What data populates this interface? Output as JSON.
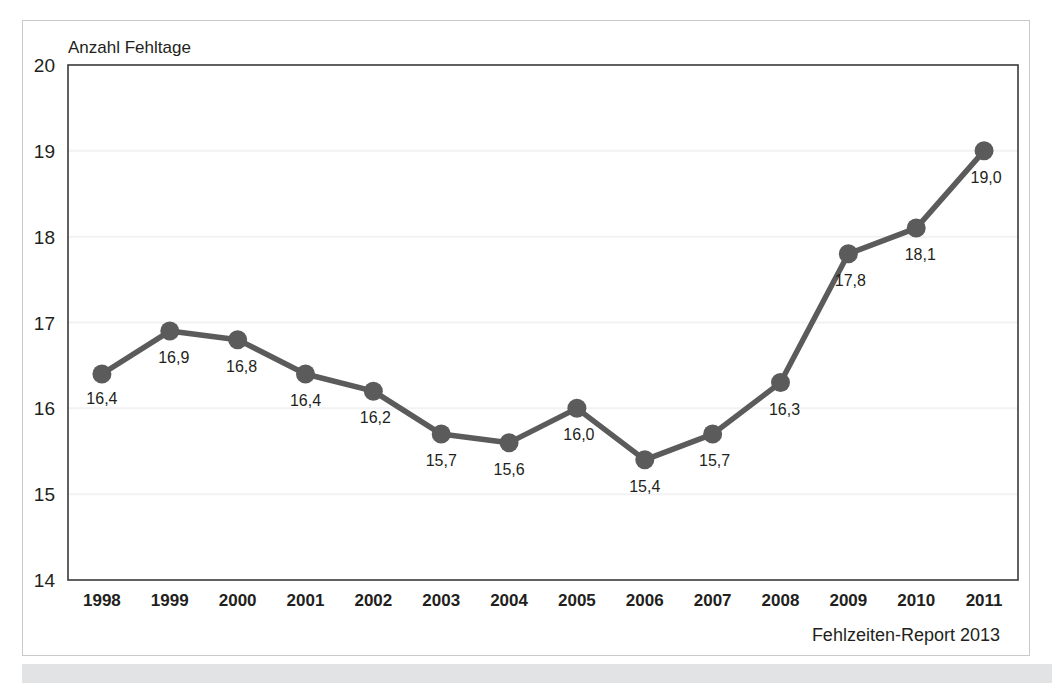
{
  "figure": {
    "footer_note": "Fehlzeiten-Report 2013"
  },
  "chart_data": {
    "type": "line",
    "title": "",
    "ylabel": "Anzahl Fehltage",
    "xlabel": "",
    "categories": [
      "1998",
      "1999",
      "2000",
      "2001",
      "2002",
      "2003",
      "2004",
      "2005",
      "2006",
      "2007",
      "2008",
      "2009",
      "2010",
      "2011"
    ],
    "values": [
      16.4,
      16.9,
      16.8,
      16.4,
      16.2,
      15.7,
      15.6,
      16.0,
      15.4,
      15.7,
      16.3,
      17.8,
      18.1,
      19.0
    ],
    "point_labels": [
      "16,4",
      "16,9",
      "16,8",
      "16,4",
      "16,2",
      "15,7",
      "15,6",
      "16,0",
      "15,4",
      "15,7",
      "16,3",
      "17,8",
      "18,1",
      "19,0"
    ],
    "label_offsets": [
      {
        "dx": 0,
        "dy": 30
      },
      {
        "dx": 4,
        "dy": 32
      },
      {
        "dx": 4,
        "dy": 32
      },
      {
        "dx": 0,
        "dy": 32
      },
      {
        "dx": 2,
        "dy": 32
      },
      {
        "dx": 0,
        "dy": 32
      },
      {
        "dx": 0,
        "dy": 32
      },
      {
        "dx": 2,
        "dy": 32
      },
      {
        "dx": 0,
        "dy": 32
      },
      {
        "dx": 2,
        "dy": 32
      },
      {
        "dx": 4,
        "dy": 32
      },
      {
        "dx": 2,
        "dy": 32
      },
      {
        "dx": 4,
        "dy": 32
      },
      {
        "dx": 2,
        "dy": 32
      }
    ],
    "yticks": [
      14,
      15,
      16,
      17,
      18,
      19,
      20
    ],
    "ytick_labels": [
      "14",
      "15",
      "16",
      "17",
      "18",
      "19",
      "20"
    ],
    "ylim": [
      14,
      20
    ],
    "grid": true,
    "legend": false,
    "series_color": "#5b5b5b",
    "grid_color": "#f2f2f4",
    "axis_color": "#3a3a3a"
  }
}
